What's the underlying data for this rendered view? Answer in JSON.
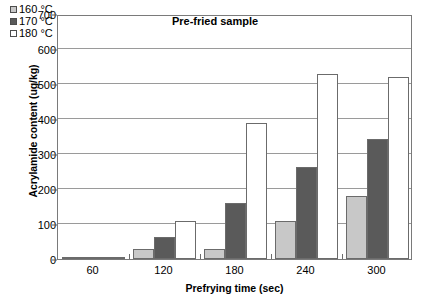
{
  "chart_data": {
    "type": "bar",
    "title": "Pre-fried sample",
    "xlabel": "Prefrying time (sec)",
    "ylabel": "Acrylamide content (ug/kg)",
    "categories": [
      "60",
      "120",
      "180",
      "240",
      "300"
    ],
    "ylim": [
      0,
      700
    ],
    "yticks": [
      0,
      100,
      200,
      300,
      400,
      500,
      600,
      700
    ],
    "grid": true,
    "legend_position": "top-left",
    "series": [
      {
        "name": "160 °C",
        "color": "#c8c8c8",
        "values": [
          2,
          30,
          30,
          110,
          180
        ]
      },
      {
        "name": "170 °C",
        "color": "#5a5a5a",
        "values": [
          2,
          62,
          160,
          262,
          342
        ]
      },
      {
        "name": "180 °C",
        "color": "#ffffff",
        "values": [
          2,
          108,
          390,
          530,
          520
        ]
      }
    ]
  }
}
